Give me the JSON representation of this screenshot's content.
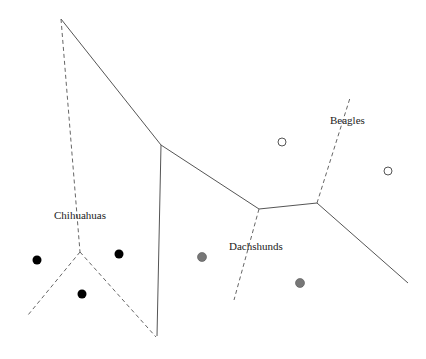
{
  "diagram": {
    "type": "voronoi-classification",
    "labels": [
      {
        "id": "chihuahuas",
        "text": "Chihuahuas",
        "x": 54,
        "y": 219
      },
      {
        "id": "dachshunds",
        "text": "Dachshunds",
        "x": 229,
        "y": 250
      },
      {
        "id": "beagles",
        "text": "Beagles",
        "x": 330,
        "y": 124
      }
    ],
    "points": [
      {
        "class": "chihuahuas",
        "x": 37,
        "y": 260,
        "style": "filled-black"
      },
      {
        "class": "chihuahuas",
        "x": 119,
        "y": 254,
        "style": "filled-black"
      },
      {
        "class": "chihuahuas",
        "x": 82,
        "y": 294,
        "style": "filled-black"
      },
      {
        "class": "dachshunds",
        "x": 202,
        "y": 257,
        "style": "filled-gray"
      },
      {
        "class": "dachshunds",
        "x": 300,
        "y": 283,
        "style": "filled-gray"
      },
      {
        "class": "beagles",
        "x": 282,
        "y": 142,
        "style": "open"
      },
      {
        "class": "beagles",
        "x": 388,
        "y": 171,
        "style": "open"
      }
    ],
    "colors": {
      "chihuahuas": "#000000",
      "dachshunds": "#777777",
      "beagles_stroke": "#555555",
      "solid_line": "#555555",
      "dashed_line": "#666666"
    }
  }
}
